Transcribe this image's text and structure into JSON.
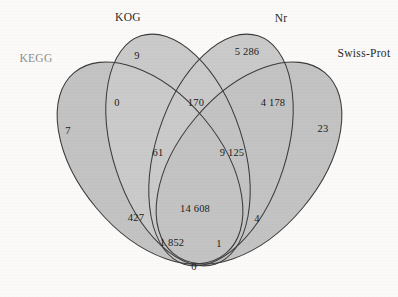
{
  "figure": {
    "kind": "four-set-venn-diagram",
    "type": "venn",
    "background_color": "#fbfaf8",
    "outline_color": "#3c3c3c"
  },
  "sets": [
    {
      "id": "kegg",
      "label": "KEGG",
      "label_style": "faded",
      "x": 36,
      "y": 58
    },
    {
      "id": "kog",
      "label": "KOG",
      "label_style": "normal",
      "x": 128,
      "y": 17
    },
    {
      "id": "nr",
      "label": "Nr",
      "label_style": "normal",
      "x": 281,
      "y": 18
    },
    {
      "id": "swissprot",
      "label": "Swiss-Prot",
      "label_style": "normal",
      "x": 364,
      "y": 53
    }
  ],
  "regions": [
    {
      "id": "kegg-only",
      "value": "7",
      "x": 68,
      "y": 130
    },
    {
      "id": "kog-only",
      "value": "9",
      "x": 137,
      "y": 55
    },
    {
      "id": "nr-only",
      "value": "5 286",
      "x": 247,
      "y": 51
    },
    {
      "id": "swissprot-only",
      "value": "23",
      "x": 323,
      "y": 128
    },
    {
      "id": "kegg-kog",
      "value": "0",
      "x": 117,
      "y": 102
    },
    {
      "id": "kog-nr",
      "value": "170",
      "x": 196,
      "y": 102
    },
    {
      "id": "nr-swissprot",
      "value": "4 178",
      "x": 273,
      "y": 102
    },
    {
      "id": "kegg-kog-nr",
      "value": "61",
      "x": 158,
      "y": 152
    },
    {
      "id": "kog-nr-swissprot",
      "value": "9 125",
      "x": 232,
      "y": 152
    },
    {
      "id": "kegg-nr",
      "value": "427",
      "x": 136,
      "y": 217
    },
    {
      "id": "kog-swissprot",
      "value": "4",
      "x": 257,
      "y": 218
    },
    {
      "id": "all-four",
      "value": "14 608",
      "x": 195,
      "y": 208
    },
    {
      "id": "kegg-nr-swissprot",
      "value": "1 852",
      "x": 172,
      "y": 242
    },
    {
      "id": "kegg-kog-swissprot",
      "value": "1",
      "x": 219,
      "y": 243
    },
    {
      "id": "kegg-swissprot",
      "value": "0",
      "x": 194,
      "y": 266
    }
  ],
  "chart_data": {
    "type": "venn",
    "title": "",
    "set_names": [
      "KEGG",
      "KOG",
      "Nr",
      "Swiss-Prot"
    ],
    "region_counts": {
      "KEGG": 7,
      "KOG": 9,
      "Nr": 5286,
      "Swiss-Prot": 23,
      "KEGG&KOG": 0,
      "KOG&Nr": 170,
      "Nr&Swiss-Prot": 4178,
      "KEGG&Nr": 427,
      "KOG&Swiss-Prot": 4,
      "KEGG&Swiss-Prot": 0,
      "KEGG&KOG&Nr": 61,
      "KOG&Nr&Swiss-Prot": 9125,
      "KEGG&Nr&Swiss-Prot": 1852,
      "KEGG&KOG&Swiss-Prot": 1,
      "KEGG&KOG&Nr&Swiss-Prot": 14608
    },
    "thousands_separator": "thin-space",
    "legend_position": "outside-labels",
    "grid": false
  }
}
